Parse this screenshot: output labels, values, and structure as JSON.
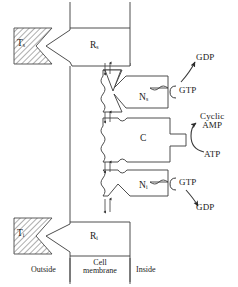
{
  "figure": {
    "type": "diagram",
    "colors": {
      "stroke": "#3a3a3a",
      "text": "#1a1a1a",
      "hatch": "#555555",
      "background": "#ffffff"
    }
  },
  "transmitters": {
    "stimulatory": {
      "base": "T",
      "sub": "s"
    },
    "inhibitory": {
      "base": "T",
      "sub": "i"
    }
  },
  "receptors": {
    "stimulatory": {
      "base": "R",
      "sub": "s"
    },
    "inhibitory": {
      "base": "R",
      "sub": "i"
    }
  },
  "g_proteins": {
    "stimulatory": {
      "base": "N",
      "sub": "s"
    },
    "inhibitory": {
      "base": "N",
      "sub": "i"
    }
  },
  "catalytic": {
    "label": "C"
  },
  "nucleotides": {
    "gtp_upper": "GTP",
    "gdp_upper": "GDP",
    "gtp_lower": "GTP",
    "gdp_lower": "GDP",
    "atp": "ATP",
    "camp_line1": "Cyclic",
    "camp_line2": "AMP"
  },
  "membrane_labels": {
    "outside": "Outside",
    "cell_line1": "Cell",
    "cell_line2": "membrane",
    "inside": "Inside"
  }
}
